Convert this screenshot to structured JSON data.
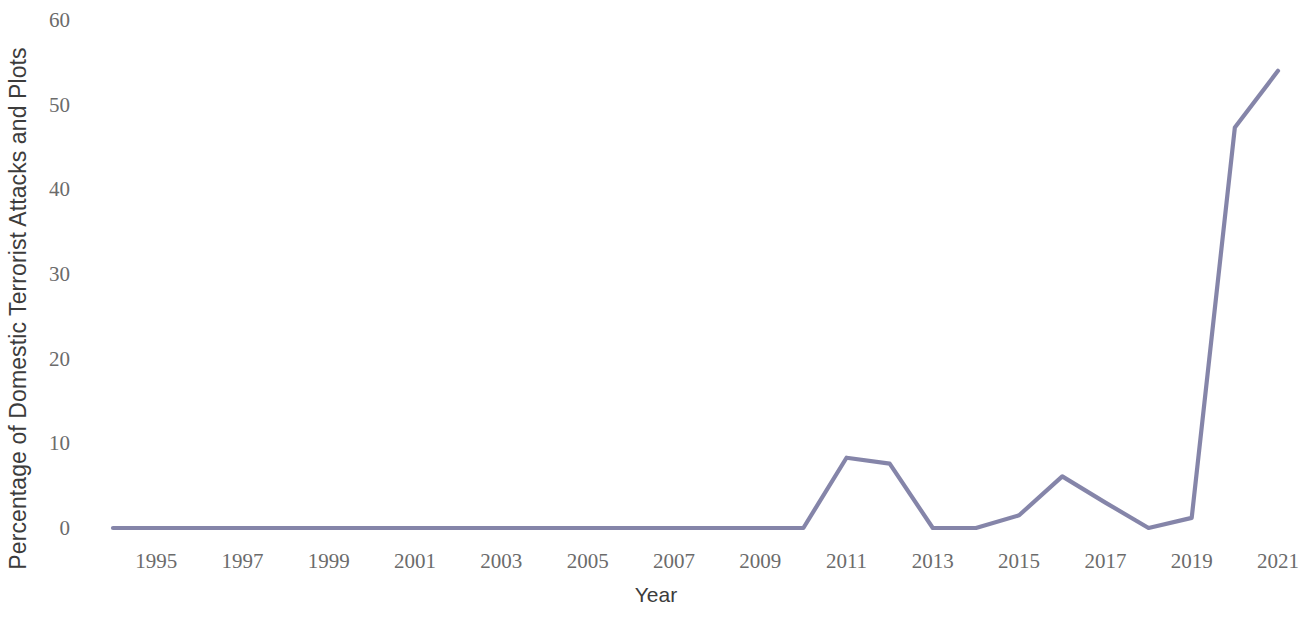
{
  "chart_data": {
    "type": "line",
    "title": "",
    "xlabel": "Year",
    "ylabel": "Percentage of Domestic Terrorist Attacks and Plots",
    "xlim": [
      1994,
      2021
    ],
    "ylim": [
      0,
      60
    ],
    "grid": false,
    "legend": "none",
    "line_color": "#7b7ba2",
    "x": [
      1994,
      1995,
      1996,
      1997,
      1998,
      1999,
      2000,
      2001,
      2002,
      2003,
      2004,
      2005,
      2006,
      2007,
      2008,
      2009,
      2010,
      2011,
      2012,
      2013,
      2014,
      2015,
      2016,
      2017,
      2018,
      2019,
      2020,
      2021
    ],
    "values": [
      0,
      0,
      0,
      0,
      0,
      0,
      0,
      0,
      0,
      0,
      0,
      0,
      0,
      0,
      0,
      0,
      0,
      8.3,
      7.6,
      0,
      0,
      1.5,
      6.1,
      3.0,
      0,
      1.2,
      47.3,
      54.0
    ],
    "series": [
      {
        "name": "Percentage of Domestic Terrorist Attacks and Plots",
        "values": [
          0,
          0,
          0,
          0,
          0,
          0,
          0,
          0,
          0,
          0,
          0,
          0,
          0,
          0,
          0,
          0,
          0,
          8.3,
          7.6,
          0,
          0,
          1.5,
          6.1,
          3.0,
          0,
          1.2,
          47.3,
          54.0
        ]
      }
    ],
    "y_ticks": [
      0,
      10,
      20,
      30,
      40,
      50,
      60
    ],
    "y_tick_labels": [
      "0",
      "10",
      "20",
      "30",
      "40",
      "50",
      "60"
    ],
    "x_ticks": [
      1995,
      1997,
      1999,
      2001,
      2003,
      2005,
      2007,
      2009,
      2011,
      2013,
      2015,
      2017,
      2019,
      2021
    ],
    "x_tick_labels": [
      "1995",
      "1997",
      "1999",
      "2001",
      "2003",
      "2005",
      "2007",
      "2009",
      "2011",
      "2013",
      "2015",
      "2017",
      "2019",
      "2021"
    ]
  }
}
